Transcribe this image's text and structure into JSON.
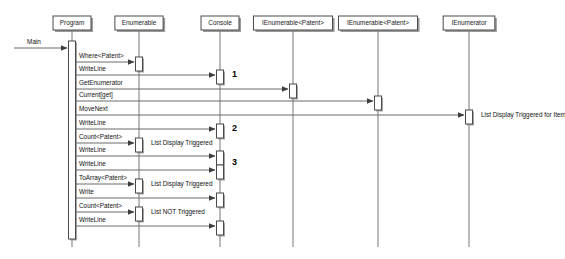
{
  "diagram": {
    "type": "uml-sequence-diagram",
    "entry_point": {
      "label": "Main",
      "target_lifeline": "Program"
    },
    "lifelines": [
      {
        "id": "program",
        "label": "Program",
        "x": 72
      },
      {
        "id": "enumerable",
        "label": "Enumerable",
        "x": 139
      },
      {
        "id": "console",
        "label": "Console",
        "x": 220
      },
      {
        "id": "ienum1",
        "label": "IEnumerable<Patent>",
        "x": 293
      },
      {
        "id": "ienum2",
        "label": "IEnumerable<Patent>",
        "x": 378
      },
      {
        "id": "ienumerator",
        "label": "IEnumerator",
        "x": 469
      }
    ],
    "messages": [
      {
        "index": 1,
        "label": "Where<Patent>",
        "from": "program",
        "to": "enumerable",
        "y": 62
      },
      {
        "index": 2,
        "label": "WriteLine",
        "from": "program",
        "to": "console",
        "y": 75
      },
      {
        "index": 3,
        "label": "GetEnumerator",
        "from": "program",
        "to": "ienum1",
        "y": 89
      },
      {
        "index": 4,
        "label": "Current[get]",
        "from": "program",
        "to": "ienum2",
        "y": 101
      },
      {
        "index": 5,
        "label": "MoveNext",
        "from": "program",
        "to": "ienumerator",
        "y": 115
      },
      {
        "index": 6,
        "label": "WriteLine",
        "from": "program",
        "to": "console",
        "y": 129
      },
      {
        "index": 7,
        "label": "Count<Patent>",
        "from": "program",
        "to": "enumerable",
        "y": 143
      },
      {
        "index": 8,
        "label": "WriteLine",
        "from": "program",
        "to": "console",
        "y": 156
      },
      {
        "index": 9,
        "label": "WriteLine",
        "from": "program",
        "to": "console",
        "y": 170
      },
      {
        "index": 10,
        "label": "ToArray<Patent>",
        "from": "program",
        "to": "enumerable",
        "y": 184
      },
      {
        "index": 11,
        "label": "Write",
        "from": "program",
        "to": "console",
        "y": 198
      },
      {
        "index": 12,
        "label": "Count<Patent>",
        "from": "program",
        "to": "enumerable",
        "y": 212
      },
      {
        "index": 13,
        "label": "WriteLine",
        "from": "program",
        "to": "console",
        "y": 226
      }
    ],
    "notes": [
      {
        "id": "note-1",
        "text": "List Display Triggered for Item",
        "x": 481,
        "y": 115
      },
      {
        "id": "note-2",
        "text": "List Display Triggered",
        "x": 151,
        "y": 143
      },
      {
        "id": "note-3",
        "text": "List Display Triggered",
        "x": 151,
        "y": 184
      },
      {
        "id": "note-4",
        "text": "List NOT Triggered",
        "x": 151,
        "y": 212
      }
    ],
    "markers": [
      {
        "id": "marker-1",
        "text": "1",
        "x": 232,
        "y": 75
      },
      {
        "id": "marker-2",
        "text": "2",
        "x": 232,
        "y": 129
      },
      {
        "id": "marker-3",
        "text": "3",
        "x": 232,
        "y": 163
      }
    ],
    "activations": [
      {
        "id": "act-program",
        "lifeline": "program",
        "y": 41,
        "height": 198
      },
      {
        "id": "act-enumerable-1",
        "lifeline": "enumerable",
        "y": 57,
        "height": 14
      },
      {
        "id": "act-enumerable-2",
        "lifeline": "enumerable",
        "y": 138,
        "height": 14
      },
      {
        "id": "act-enumerable-3",
        "lifeline": "enumerable",
        "y": 179,
        "height": 14
      },
      {
        "id": "act-enumerable-4",
        "lifeline": "enumerable",
        "y": 207,
        "height": 14
      },
      {
        "id": "act-console-1",
        "lifeline": "console",
        "y": 70,
        "height": 14
      },
      {
        "id": "act-console-2",
        "lifeline": "console",
        "y": 124,
        "height": 14
      },
      {
        "id": "act-console-3",
        "lifeline": "console",
        "y": 151,
        "height": 14
      },
      {
        "id": "act-console-4",
        "lifeline": "console",
        "y": 165,
        "height": 14
      },
      {
        "id": "act-console-5",
        "lifeline": "console",
        "y": 193,
        "height": 14
      },
      {
        "id": "act-console-6",
        "lifeline": "console",
        "y": 221,
        "height": 14
      },
      {
        "id": "act-ienum1-1",
        "lifeline": "ienum1",
        "y": 84,
        "height": 14
      },
      {
        "id": "act-ienum2-1",
        "lifeline": "ienum2",
        "y": 96,
        "height": 14
      },
      {
        "id": "act-ienumerator-1",
        "lifeline": "ienumerator",
        "y": 110,
        "height": 14
      }
    ],
    "colors": {
      "background": "#ffffff",
      "box_stroke": "#4a4a4a",
      "lifeline_stroke": "#777777",
      "arrow_stroke": "#6b6b6b",
      "text": "#111111",
      "shadow": "#9a9a9a"
    }
  }
}
